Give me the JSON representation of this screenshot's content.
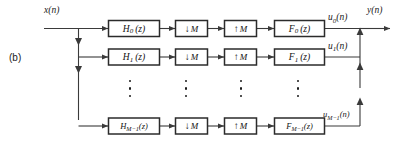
{
  "figure": {
    "panel_label": "(b)",
    "title_inputs": {
      "input_signal": "x(n)",
      "output_signal": "y(n)"
    },
    "colors": {
      "line": "#3a3a3a",
      "box_border": "#2b2b2b",
      "box_fill": "#ffffff",
      "text": "#1a1a1a",
      "background": "#ffffff"
    },
    "branches": [
      {
        "analysis_filter": "H",
        "analysis_filter_sub": "0",
        "analysis_filter_arg": "(z)",
        "analysis_filter_full": "H0(z)",
        "decimator": "M",
        "decimator_icon": "down-arrow-icon",
        "interpolator": "M",
        "interpolator_icon": "up-arrow-icon",
        "synthesis_filter": "F",
        "synthesis_filter_sub": "0",
        "synthesis_filter_arg": "(z)",
        "synthesis_filter_full": "F0(z)",
        "subband_signal": "u",
        "subband_signal_sub": "0",
        "subband_signal_arg": "(n)",
        "subband_signal_full": "u0(n)"
      },
      {
        "analysis_filter": "H",
        "analysis_filter_sub": "1",
        "analysis_filter_arg": "(z)",
        "analysis_filter_full": "H1(z)",
        "decimator": "M",
        "decimator_icon": "down-arrow-icon",
        "interpolator": "M",
        "interpolator_icon": "up-arrow-icon",
        "synthesis_filter": "F",
        "synthesis_filter_sub": "1",
        "synthesis_filter_arg": "(z)",
        "synthesis_filter_full": "F1(z)",
        "subband_signal": "u",
        "subband_signal_sub": "1",
        "subband_signal_arg": "(n)",
        "subband_signal_full": "u1(n)"
      },
      {
        "analysis_filter": "H",
        "analysis_filter_sub": "M−1",
        "analysis_filter_arg": "(z)",
        "analysis_filter_full": "HM−1(z)",
        "decimator": "M",
        "decimator_icon": "down-arrow-icon",
        "interpolator": "M",
        "interpolator_icon": "up-arrow-icon",
        "synthesis_filter": "F",
        "synthesis_filter_sub": "M−1",
        "synthesis_filter_arg": "(z)",
        "synthesis_filter_full": "FM−1(z)",
        "subband_signal": "u",
        "subband_signal_sub": "M−1",
        "subband_signal_arg": "(n)",
        "subband_signal_full": "uM−1(n)"
      }
    ],
    "ellipsis_columns": 4
  }
}
